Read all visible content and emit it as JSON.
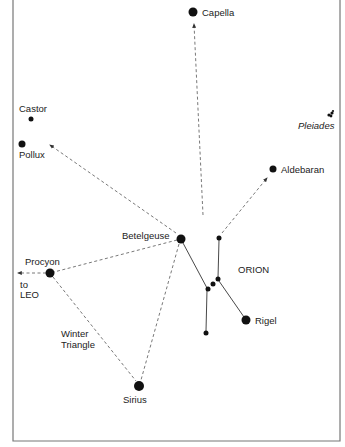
{
  "diagram": {
    "stars": [
      {
        "id": "capella",
        "label": "Capella"
      },
      {
        "id": "castor",
        "label": "Castor"
      },
      {
        "id": "pollux",
        "label": "Pollux"
      },
      {
        "id": "pleiades",
        "label": "Pleiades"
      },
      {
        "id": "aldebaran",
        "label": "Aldebaran"
      },
      {
        "id": "betelgeuse",
        "label": "Betelgeuse"
      },
      {
        "id": "procyon",
        "label": "Procyon"
      },
      {
        "id": "rigel",
        "label": "Rigel"
      },
      {
        "id": "sirius",
        "label": "Sirius"
      }
    ],
    "constellation_label": "ORION",
    "winter_triangle_label_line1": "Winter",
    "winter_triangle_label_line2": "Triangle",
    "to_leo_line1": "to",
    "to_leo_line2": "LEO",
    "colors": {
      "star": "#111111",
      "line": "#555555",
      "frame": "#777777",
      "background": "#ffffff"
    }
  }
}
